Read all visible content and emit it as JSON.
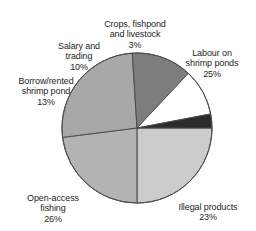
{
  "chart_data": {
    "type": "pie",
    "title": "",
    "subtitle": "",
    "xlabel": "",
    "ylabel": "",
    "legend_position": "none",
    "grid": false,
    "units": "percent",
    "start_angle_deg": 0,
    "direction": "clockwise",
    "categories": [
      "Labour on shrimp ponds",
      "Illegal products",
      "Open-access fishing",
      "Borrow/rented shrimp pond",
      "Salary and trading",
      "Crops, fishpond and livestock"
    ],
    "values": [
      25,
      23,
      26,
      13,
      10,
      3
    ],
    "slices": [
      {
        "id": "labour",
        "label": "Labour on\nshrimp ponds",
        "value": 25,
        "value_text": "25%",
        "color": "#cccccc"
      },
      {
        "id": "illegal",
        "label": "Illegal products",
        "value": 23,
        "value_text": "23%",
        "color": "#b3b3b3"
      },
      {
        "id": "open-access",
        "label": "Open-access\nfishing",
        "value": 26,
        "value_text": "26%",
        "color": "#a8a8a8"
      },
      {
        "id": "borrow-rented",
        "label": "Borrow/rented\nshrimp pond",
        "value": 13,
        "value_text": "13%",
        "color": "#7d7d7d"
      },
      {
        "id": "salary-trading",
        "label": "Salary and\ntrading",
        "value": 10,
        "value_text": "10%",
        "color": "#ffffff"
      },
      {
        "id": "crops-fishpond-livestock",
        "label": "Crops, fishpond\nand livestock",
        "value": 3,
        "value_text": "3%",
        "color": "#2b2b2b"
      }
    ],
    "geometry": {
      "center_x": 137,
      "center_y": 128,
      "radius": 75,
      "outline_color": "#4d4d4d",
      "outline_width": 1
    }
  }
}
